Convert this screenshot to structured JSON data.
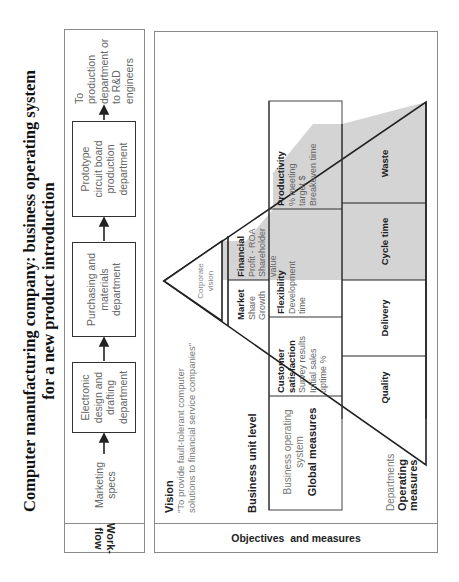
{
  "title": {
    "line1": "Computer manufacturing company: business operating system",
    "line2": "for a new product introduction"
  },
  "workflow": {
    "label_line1": "Work-",
    "label_line2": "flow",
    "steps": [
      {
        "lines": [
          "Marketing",
          "specs"
        ],
        "boxed": false
      },
      {
        "lines": [
          "Electronic",
          "design and",
          "drafting",
          "department"
        ],
        "boxed": true
      },
      {
        "lines": [
          "Purchasing and",
          "materials",
          "department"
        ],
        "boxed": true
      },
      {
        "lines": [
          "Prototype",
          "circuit board",
          "production",
          "department"
        ],
        "boxed": true
      },
      {
        "lines": [
          "To",
          "production",
          "department or",
          "to R&D",
          "engineers"
        ],
        "boxed": false
      }
    ],
    "arrow_icon": "arrow-right"
  },
  "objectives": {
    "label": "Objectives  and measures",
    "vision": {
      "heading": "Vision",
      "line1": "\"To provide fault-tolerant computer",
      "line2": "solutions to financial service companies\""
    },
    "business_unit_level": "Business unit level",
    "business_operating_system": {
      "line1": "Business operating",
      "line2": "system",
      "line3": "Global measures"
    },
    "departments": {
      "line1": "Departments",
      "line2": "Operating",
      "line3": "measures"
    },
    "corporate_vision": {
      "line1": "Corporate",
      "line2": "vision"
    },
    "business_unit_cells": [
      {
        "heading": "Market",
        "lines": [
          "Share",
          "Growth"
        ],
        "shaded": false
      },
      {
        "heading": "Financial",
        "lines": [
          "Profit - ROA",
          "Shareholder",
          "value"
        ],
        "shaded": true
      }
    ],
    "global_cells": [
      {
        "heading": "Customer",
        "heading2": "satisfaction",
        "lines": [
          "Survey results",
          "Initial sales",
          "uptime %"
        ],
        "shaded": false
      },
      {
        "heading": "Flexibility",
        "lines": [
          "Development",
          "time"
        ],
        "shaded": false
      },
      {
        "heading": "Productivity",
        "lines": [
          "% meeting",
          "target $",
          "Breakeven time"
        ],
        "shaded": true
      }
    ],
    "operating_cells": [
      {
        "label": "Quality",
        "shaded": false
      },
      {
        "label": "Delivery",
        "shaded": false
      },
      {
        "label": "Cycle time",
        "shaded": true
      },
      {
        "label": "Waste",
        "shaded": true
      }
    ]
  },
  "colors": {
    "shade": "#d4d4d4",
    "line": "#222222",
    "frame": "#8a8a8a"
  }
}
